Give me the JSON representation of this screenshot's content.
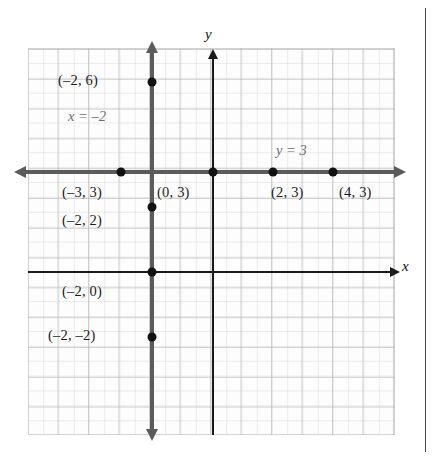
{
  "figure": {
    "type": "coordinate-plane-diagram",
    "axes": {
      "x_label": "x",
      "y_label": "y",
      "origin_px": [
        213,
        272
      ],
      "unit_px": 30,
      "x_range": [
        -6,
        6
      ],
      "y_range": [
        -5,
        8
      ]
    },
    "equation_labels": [
      {
        "id": "vertical-line-eq",
        "text": "x = –2",
        "x_px": 68,
        "y_px": 108
      },
      {
        "id": "horizontal-line-eq",
        "text": "y = 3",
        "x_px": 276,
        "y_px": 142
      }
    ],
    "lines": [
      {
        "id": "line-x-equals-neg2",
        "equation": "x = -2",
        "orientation": "vertical",
        "value": -2
      },
      {
        "id": "line-y-equals-3",
        "equation": "y = 3",
        "orientation": "horizontal",
        "value": 3
      }
    ],
    "points": [
      {
        "id": "point-neg2-6",
        "label": "(–2, 6)",
        "x": -2,
        "y": 6,
        "px": 152,
        "py": 82,
        "label_x": 58,
        "label_y": 72,
        "label_align": "right"
      },
      {
        "id": "point-neg3-3",
        "label": "(–3, 3)",
        "x": -3,
        "y": 3,
        "px": 121,
        "py": 172,
        "label_x": 62,
        "label_y": 184,
        "label_align": "left"
      },
      {
        "id": "point-0-3",
        "label": "(0, 3)",
        "x": 0,
        "y": 3,
        "px": 213,
        "py": 172,
        "label_x": 157,
        "label_y": 184,
        "label_align": "left"
      },
      {
        "id": "point-2-3",
        "label": "(2, 3)",
        "x": 2,
        "y": 3,
        "px": 273,
        "py": 172,
        "label_x": 271,
        "label_y": 184,
        "label_align": "left"
      },
      {
        "id": "point-4-3",
        "label": "(4, 3)",
        "x": 4,
        "y": 3,
        "px": 333,
        "py": 172,
        "label_x": 339,
        "label_y": 184,
        "label_align": "left"
      },
      {
        "id": "point-neg2-2",
        "label": "(–2, 2)",
        "x": -2,
        "y": 2,
        "px": 152,
        "py": 207,
        "label_x": 62,
        "label_y": 212,
        "label_align": "left"
      },
      {
        "id": "point-neg2-0",
        "label": "(–2, 0)",
        "x": -2,
        "y": 0,
        "px": 152,
        "py": 272,
        "label_x": 62,
        "label_y": 283,
        "label_align": "left"
      },
      {
        "id": "point-neg2-neg2",
        "label": "(–2, –2)",
        "x": -2,
        "y": -2,
        "px": 152,
        "py": 337,
        "label_x": 48,
        "label_y": 327,
        "label_align": "left"
      }
    ],
    "grid": {
      "visible": true,
      "left_px": 28,
      "top_px": 48,
      "width_px": 367,
      "height_px": 387,
      "cell_px": 30
    },
    "colors": {
      "line": "#5b5b5b",
      "axis": "#1a1a1a",
      "point": "#111111",
      "grid": "#aaaaaf",
      "equation_label": "#6e6e72",
      "point_label": "#1b1b1b",
      "rule": "#4a4a4a"
    }
  }
}
